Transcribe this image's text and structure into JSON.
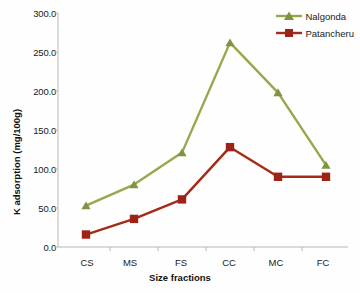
{
  "chart_data": {
    "type": "line",
    "title": "",
    "xlabel": "Size fractions",
    "ylabel": "K adsorption (mg/100g)",
    "categories": [
      "CS",
      "MS",
      "FS",
      "CC",
      "MC",
      "FC"
    ],
    "ylim": [
      0,
      300
    ],
    "ytick_labels": [
      "0.0",
      "50.0",
      "100.0",
      "150.0",
      "200.0",
      "250.0",
      "300.0"
    ],
    "ytick_values": [
      0,
      50,
      100,
      150,
      200,
      250,
      300
    ],
    "grid": false,
    "legend_position": "top-right",
    "series": [
      {
        "name": "Nalgonda",
        "color": "#94A94C",
        "marker": "triangle",
        "values": [
          53,
          80,
          121,
          262,
          198,
          105
        ]
      },
      {
        "name": "Patancheru",
        "color": "#A52A18",
        "marker": "square",
        "values": [
          16,
          36,
          61,
          128,
          90,
          90
        ]
      }
    ]
  }
}
